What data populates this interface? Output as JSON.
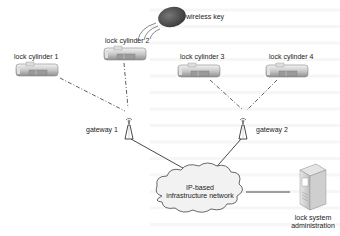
{
  "diagram": {
    "wireless_key": {
      "label": "wireless key",
      "icon": "key-fob-icon"
    },
    "lock_cylinders": [
      {
        "label": "lock cylinder 1"
      },
      {
        "label": "lock cylinder 2"
      },
      {
        "label": "lock cylinder 3"
      },
      {
        "label": "lock cylinder 4"
      }
    ],
    "gateways": [
      {
        "label": "gateway 1"
      },
      {
        "label": "gateway 2"
      }
    ],
    "network": {
      "label_line1": "IP-based",
      "label_line2": "infrastructure network"
    },
    "admin": {
      "label_line1": "lock system",
      "label_line2": "administration",
      "icon": "server-icon"
    },
    "colors": {
      "line": "#333333",
      "cloud_fill": "#f2f2f2",
      "key_fill": "#555555"
    }
  }
}
